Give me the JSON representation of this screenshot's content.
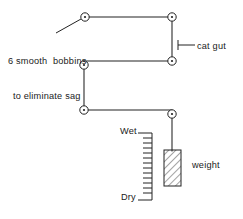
{
  "figure": {
    "background_color": "#ffffff",
    "stroke_color": "#222222",
    "text_color": "#1a1a1a",
    "width": 243,
    "height": 219
  },
  "labels": {
    "bobbins_line1": "6 smooth  bobbins",
    "bobbins_line2": "to eliminate sag",
    "cat_gut": "cat gut",
    "wet": "Wet",
    "dry": "Dry",
    "weight": "weight"
  },
  "components": {
    "bobbins": [
      {
        "name": "bobbin-top-left",
        "cx": 85,
        "cy": 17
      },
      {
        "name": "bobbin-top-right",
        "cx": 172,
        "cy": 17
      },
      {
        "name": "bobbin-mid-right",
        "cx": 172,
        "cy": 61
      },
      {
        "name": "bobbin-mid-left",
        "cx": 84,
        "cy": 65
      },
      {
        "name": "bobbin-lower-left",
        "cx": 84,
        "cy": 110
      },
      {
        "name": "bobbin-lower-right",
        "cx": 172,
        "cy": 114
      }
    ],
    "bobbin_outer_radius": 4.2,
    "bobbin_inner_radius": 1.1,
    "gut_path_segments": [
      "top-left to top-right",
      "top-right down to mid-right",
      "mid-right to mid-left",
      "mid-left down to lower-left",
      "lower-left to lower-right",
      "lower-right down to weight"
    ],
    "scale": {
      "name": "wet-dry-scale",
      "x": 152,
      "top_y": 133,
      "bottom_y": 200,
      "tick_count": 14,
      "tick_length": 9,
      "end_tick_length": 14
    },
    "weight_block": {
      "name": "weight-block",
      "x": 172,
      "y": 150,
      "width": 17,
      "height": 36,
      "hatch": "diagonal"
    },
    "leader_lines": [
      {
        "name": "bobbins-leader",
        "x1": 56,
        "y1": 33,
        "x2": 81,
        "y2": 19
      },
      {
        "name": "catgut-leader",
        "x1": 178,
        "y1": 45,
        "x2": 194,
        "y2": 45
      }
    ]
  }
}
